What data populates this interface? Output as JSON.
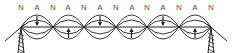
{
  "diagram": {
    "labels": [
      "N",
      "A",
      "N",
      "A",
      "N",
      "A",
      "N",
      "A",
      "N",
      "A",
      "N",
      "A",
      "N"
    ],
    "label_x": [
      21,
      37,
      53,
      68,
      84,
      100,
      116,
      132,
      147,
      163,
      179,
      195,
      211
    ],
    "node_x": [
      21,
      53,
      84,
      116,
      147,
      179,
      211
    ],
    "axis_y": 27,
    "outer_amplitude": 12,
    "inner_amplitude": 7,
    "loop_arrows": [
      "down",
      "up",
      "down",
      "up",
      "down",
      "up"
    ],
    "stroke_color": "#222222",
    "label_color": "#555555",
    "supports": [
      {
        "side": "left",
        "x": 21
      },
      {
        "side": "right",
        "x": 211
      }
    ]
  }
}
